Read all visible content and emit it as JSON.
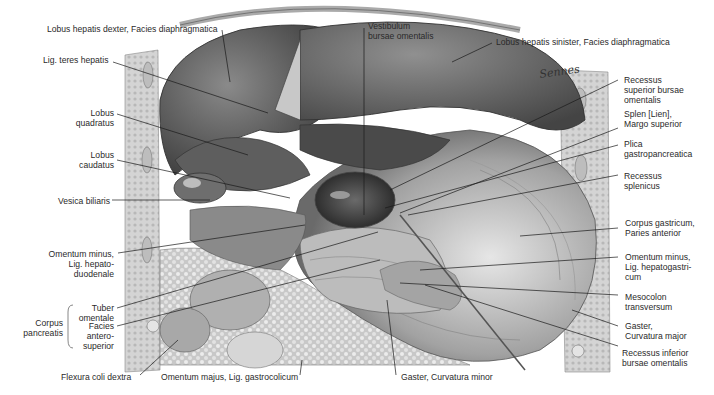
{
  "figure": {
    "signature": "Sennes",
    "colors": {
      "background": "#ffffff",
      "text": "#2a2a2a",
      "leader_line": "#1a1a1a",
      "liver_dark": "#5a5a5a",
      "liver_light": "#8c8c8c",
      "stomach": "#a8a8a8",
      "abdominal_wall": "#cfcfcf"
    }
  },
  "labels": {
    "lobus_hepatis_dexter": "Lobus hepatis dexter, Facies diaphragmatica",
    "vestibulum": "Vestibulum\nbursae omentalis",
    "lobus_hepatis_sinister": "Lobus hepatis sinister, Facies diaphragmatica",
    "lig_teres": "Lig. teres hepatis",
    "recessus_superior": "Recessus\nsuperior bursae\nomentalis",
    "lobus_quadratus": "Lobus\nquadratus",
    "splen": "Splen [Lien],\nMargo superior",
    "lobus_caudatus": "Lobus\ncaudatus",
    "plica": "Plica\ngastropancreatica",
    "recessus_splenicus": "Recessus\nsplenicus",
    "vesica_biliaris": "Vesica biliaris",
    "corpus_gastricum": "Corpus gastricum,\nParies anterior",
    "omentum_minus_hd": "Omentum minus,\nLig. hepato-\nduodenale",
    "omentum_minus_hg": "Omentum minus,\nLig. hepatogastri-\ncum",
    "tuber_omentale": "Tuber\nomentale",
    "mesocolon": "Mesocolon\ntransversum",
    "corpus_pancreatis": "Corpus\npancreatis",
    "facies_anterosuperior": "Facies\nantero-\nsuperior",
    "gaster_major": "Gaster,\nCurvatura major",
    "recessus_inferior": "Recessus inferior\nbursae omentalis",
    "flexura_coli": "Flexura coli dextra",
    "omentum_majus": "Omentum majus, Lig. gastrocolicum",
    "gaster_minor": "Gaster, Curvatura minor"
  }
}
